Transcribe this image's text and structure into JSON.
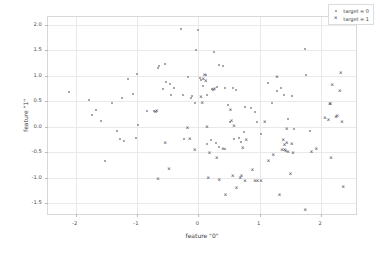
{
  "chart_data": {
    "type": "scatter",
    "title": "",
    "xlabel": "feature \"0\"",
    "ylabel": "feature \"1\"",
    "xlim": [
      -2.45,
      2.6
    ],
    "ylim": [
      -1.75,
      2.15
    ],
    "xticks": [
      -2,
      -1,
      0,
      1,
      2
    ],
    "xticklabels": [
      "-2",
      "-1",
      "0",
      "1",
      "2"
    ],
    "yticks": [
      -1.5,
      -1.0,
      -0.5,
      0.0,
      0.5,
      1.0,
      1.5,
      2.0
    ],
    "yticklabels": [
      "-1.5",
      "-1.0",
      "-0.5",
      "0.0",
      "0.5",
      "1.0",
      "1.5",
      "2.0"
    ],
    "grid": true,
    "legend_position": "upper right",
    "series": [
      {
        "name": "target = 0",
        "marker": "dot",
        "color": "#8a8a96",
        "points": [
          [
            -2.11,
            0.68
          ],
          [
            -1.78,
            0.52
          ],
          [
            -1.74,
            0.22
          ],
          [
            -1.66,
            0.33
          ],
          [
            -1.58,
            0.11
          ],
          [
            -1.52,
            -0.67
          ],
          [
            -1.4,
            0.47
          ],
          [
            -1.33,
            -0.09
          ],
          [
            -1.28,
            -0.25
          ],
          [
            -1.24,
            0.56
          ],
          [
            -1.21,
            -0.28
          ],
          [
            -1.14,
            0.93
          ],
          [
            -1.07,
            0.64
          ],
          [
            -1.02,
            -0.22
          ],
          [
            -1.0,
            1.04
          ],
          [
            -0.98,
            0.03
          ],
          [
            -0.84,
            0.31
          ],
          [
            -0.72,
            0.3
          ],
          [
            -0.66,
            1.16
          ],
          [
            -0.64,
            1.19
          ],
          [
            -0.58,
            0.73
          ],
          [
            -0.55,
            1.23
          ],
          [
            -0.52,
            0.88
          ],
          [
            -0.47,
            0.83
          ],
          [
            -0.44,
            0.62
          ],
          [
            -0.4,
            0.76
          ],
          [
            -0.29,
            1.91
          ],
          [
            -0.25,
            0.63
          ],
          [
            -0.17,
            0.97
          ],
          [
            -0.12,
            0.57
          ],
          [
            -0.1,
            0.61
          ],
          [
            -0.06,
            0.47
          ],
          [
            -0.04,
            1.5
          ],
          [
            0.0,
            1.89
          ],
          [
            0.02,
            0.96
          ],
          [
            0.04,
            0.92
          ],
          [
            0.08,
            0.79
          ],
          [
            0.12,
            1.01
          ],
          [
            0.14,
            0.62
          ],
          [
            0.22,
            0.74
          ],
          [
            0.26,
            1.47
          ],
          [
            0.3,
            0.77
          ],
          [
            0.34,
            1.21
          ],
          [
            0.4,
            1.19
          ],
          [
            0.44,
            0.76
          ],
          [
            0.48,
            0.42
          ],
          [
            0.52,
            0.09
          ],
          [
            0.56,
            0.75
          ],
          [
            0.62,
            0.71
          ],
          [
            0.66,
            -0.22
          ],
          [
            0.7,
            -0.29
          ],
          [
            0.76,
            0.38
          ],
          [
            0.86,
            0.37
          ],
          [
            0.92,
            0.29
          ],
          [
            0.96,
            0.09
          ],
          [
            1.02,
            -0.15
          ],
          [
            1.14,
            0.86
          ],
          [
            1.2,
            0.47
          ],
          [
            1.28,
            0.7
          ],
          [
            1.34,
            0.76
          ],
          [
            1.4,
            0.62
          ],
          [
            1.46,
            0.16
          ],
          [
            1.52,
            0.61
          ],
          [
            1.56,
            -0.05
          ],
          [
            1.74,
            1.53
          ],
          [
            1.76,
            1.02
          ],
          [
            1.82,
            -0.08
          ],
          [
            0.14,
            -0.34
          ],
          [
            0.28,
            -0.31
          ],
          [
            0.2,
            -0.27
          ],
          [
            -0.24,
            -0.25
          ],
          [
            0.44,
            -0.44
          ],
          [
            0.58,
            -0.25
          ],
          [
            0.74,
            -0.11
          ],
          [
            0.34,
            -0.4
          ]
        ]
      },
      {
        "name": "target = 1",
        "marker": "x",
        "color": "#55555f",
        "points": [
          [
            -0.7,
            0.28
          ],
          [
            -0.68,
            0.3
          ],
          [
            -0.66,
            -1.02
          ],
          [
            -0.54,
            -0.32
          ],
          [
            -0.48,
            -0.82
          ],
          [
            -0.18,
            -0.02
          ],
          [
            -0.14,
            -0.25
          ],
          [
            -0.06,
            -0.46
          ],
          [
            0.04,
            0.58
          ],
          [
            0.06,
            0.47
          ],
          [
            0.08,
            0.94
          ],
          [
            0.1,
            1.02
          ],
          [
            0.12,
            0.9
          ],
          [
            0.14,
            -0.01
          ],
          [
            0.16,
            -1.01
          ],
          [
            0.18,
            -0.52
          ],
          [
            0.24,
            0.71
          ],
          [
            0.26,
            0.74
          ],
          [
            0.3,
            -0.62
          ],
          [
            0.34,
            -1.04
          ],
          [
            0.4,
            -0.44
          ],
          [
            0.44,
            -1.34
          ],
          [
            0.52,
            0.33
          ],
          [
            0.54,
            0.11
          ],
          [
            0.56,
            -0.97
          ],
          [
            0.58,
            0.01
          ],
          [
            0.62,
            -1.21
          ],
          [
            0.68,
            -1.01
          ],
          [
            0.7,
            -0.96
          ],
          [
            0.72,
            -0.42
          ],
          [
            0.76,
            -1.07
          ],
          [
            0.78,
            -0.26
          ],
          [
            0.88,
            -0.85
          ],
          [
            0.92,
            -1.07
          ],
          [
            0.96,
            -1.06
          ],
          [
            1.02,
            -1.07
          ],
          [
            1.08,
            0.1
          ],
          [
            1.14,
            -0.68
          ],
          [
            1.22,
            -0.55
          ],
          [
            1.28,
            0.98
          ],
          [
            1.32,
            -1.34
          ],
          [
            1.36,
            -0.45
          ],
          [
            1.38,
            -0.27
          ],
          [
            1.4,
            -0.35
          ],
          [
            1.42,
            -0.48
          ],
          [
            1.44,
            -0.04
          ],
          [
            1.46,
            -0.5
          ],
          [
            1.5,
            -0.92
          ],
          [
            1.52,
            -0.33
          ],
          [
            1.54,
            -0.51
          ],
          [
            1.74,
            -1.64
          ],
          [
            1.84,
            -0.5
          ],
          [
            1.92,
            -0.43
          ],
          [
            2.06,
            0.17
          ],
          [
            2.12,
            0.14
          ],
          [
            2.14,
            0.44
          ],
          [
            2.15,
            0.45
          ],
          [
            2.16,
            -0.61
          ],
          [
            2.18,
            0.82
          ],
          [
            2.24,
            0.2
          ],
          [
            2.26,
            0.21
          ],
          [
            2.3,
            0.7
          ],
          [
            2.32,
            1.06
          ],
          [
            2.34,
            0.09
          ],
          [
            2.36,
            -1.18
          ],
          [
            1.4,
            -0.46
          ],
          [
            1.44,
            -0.32
          ]
        ]
      }
    ]
  }
}
